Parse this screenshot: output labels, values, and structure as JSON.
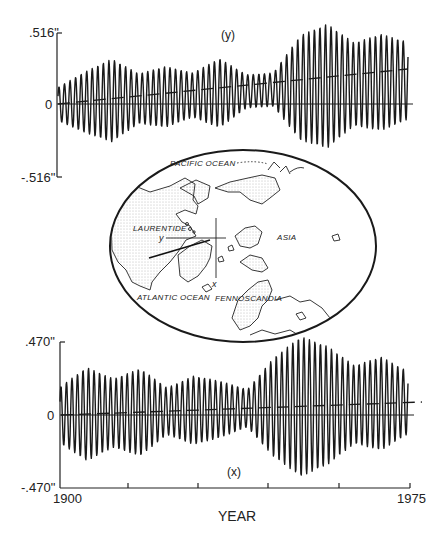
{
  "chart_data": [
    {
      "type": "line",
      "title": "(y)",
      "xlabel": "",
      "ylabel": "",
      "x_range": [
        1900,
        1975
      ],
      "ylim": [
        -0.516,
        0.516
      ],
      "y_tick_labels": [
        ".516\"",
        "0",
        "-.516\""
      ],
      "grid": false,
      "series": [
        {
          "name": "polar motion y-component",
          "description": "oscillation (~Chandler wobble, ~1.2-yr period) with beat envelope",
          "amplitude_envelope_approx": [
            0.12,
            0.22,
            0.3,
            0.18,
            0.22,
            0.16,
            0.25,
            0.12,
            0.12,
            0.38,
            0.45,
            0.3,
            0.35,
            0.28
          ]
        },
        {
          "name": "secular trend (dashed)",
          "x": [
            1900,
            1975
          ],
          "values": [
            0.0,
            0.17
          ]
        }
      ]
    },
    {
      "type": "line",
      "title": "(x)",
      "xlabel": "YEAR",
      "ylabel": "",
      "x_range": [
        1900,
        1975
      ],
      "x_tick_labels": [
        "1900",
        "1975"
      ],
      "x_ticks": [
        1900,
        1915,
        1930,
        1945,
        1960,
        1975
      ],
      "ylim": [
        -0.47,
        0.47
      ],
      "y_tick_labels": [
        ".470\"",
        "0",
        "-.470\""
      ],
      "grid": false,
      "series": [
        {
          "name": "polar motion x-component",
          "description": "oscillation (~Chandler wobble) with beat envelope",
          "amplitude_envelope_approx": [
            0.18,
            0.3,
            0.22,
            0.28,
            0.15,
            0.22,
            0.18,
            0.12,
            0.32,
            0.45,
            0.38,
            0.25,
            0.3,
            0.2
          ]
        },
        {
          "name": "secular trend (dashed)",
          "x": [
            1900,
            1975
          ],
          "values": [
            0.0,
            0.08
          ]
        }
      ]
    }
  ],
  "top_plot": {
    "title": "(y)",
    "y_max_label": ".516\"",
    "y_zero_label": "0",
    "y_min_label": "-.516\""
  },
  "bottom_plot": {
    "title": "(x)",
    "y_max_label": ".470\"",
    "y_zero_label": "0",
    "y_min_label": "-.470\"",
    "x_start_label": "1900",
    "x_end_label": "1975",
    "x_axis_label": "YEAR"
  },
  "map": {
    "labels": {
      "pacific": "PACIFIC OCEAN",
      "laurentide": "LAURENTIDE",
      "asia": "ASIA",
      "atlantic": "ATLANTIC OCEAN",
      "fennoscandia": "FENNOSCANDIA",
      "axis_y": "y",
      "axis_x": "x"
    }
  }
}
